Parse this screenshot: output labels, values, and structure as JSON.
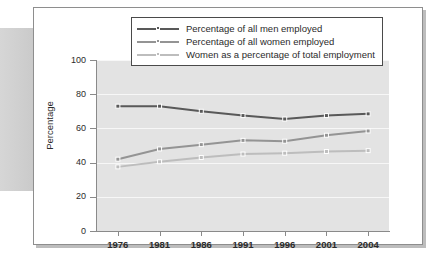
{
  "figure": {
    "ylabel": "Percentage",
    "legend": {
      "items": [
        {
          "label": "Percentage of all men employed",
          "color": "#595959"
        },
        {
          "label": "Percentage of all women employed",
          "color": "#949494"
        },
        {
          "label": "Women as a percentage of total employment",
          "color": "#bdbdbd"
        }
      ]
    }
  },
  "chart_data": {
    "type": "line",
    "title": "",
    "xlabel": "",
    "ylabel": "Percentage",
    "categories": [
      "1976",
      "1981",
      "1986",
      "1991",
      "1996",
      "2001",
      "2004"
    ],
    "x": [
      1976,
      1981,
      1986,
      1991,
      1996,
      2001,
      2004
    ],
    "ylim": [
      0,
      100
    ],
    "yticks": [
      0,
      20,
      40,
      60,
      80,
      100
    ],
    "ytick_labels": [
      "0",
      "20",
      "40",
      "60",
      "80",
      "100"
    ],
    "grid": true,
    "grid_axis": "y",
    "legend_position": "top-center",
    "series": [
      {
        "name": "Percentage of all men employed",
        "color": "#595959",
        "values": [
          73,
          73,
          70,
          67.5,
          65.5,
          67.5,
          68.5
        ]
      },
      {
        "name": "Percentage of all women employed",
        "color": "#949494",
        "values": [
          42,
          48,
          50.5,
          53,
          52.5,
          56,
          58.5
        ]
      },
      {
        "name": "Women as a percentage of total employment",
        "color": "#bdbdbd",
        "values": [
          37.5,
          40.5,
          43,
          45,
          45.5,
          46.5,
          47
        ]
      }
    ]
  }
}
